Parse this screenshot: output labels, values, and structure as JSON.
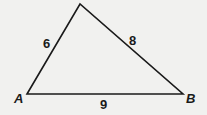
{
  "diagram": {
    "type": "triangle",
    "vertices": {
      "A": {
        "label": "A",
        "x": 27,
        "y": 94
      },
      "B": {
        "label": "B",
        "x": 183,
        "y": 94
      },
      "C": {
        "label": "",
        "x": 80,
        "y": 4
      }
    },
    "sides": {
      "AC": {
        "label": "6"
      },
      "CB": {
        "label": "8"
      },
      "AB": {
        "label": "9"
      }
    },
    "colors": {
      "line": "#1a1a1a",
      "background": "#f1f1ef"
    }
  }
}
